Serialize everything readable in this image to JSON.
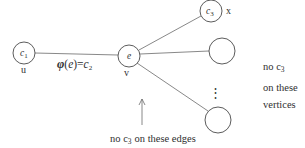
{
  "diagram_title": "edge-coloring gadget around vertex v",
  "nodes": {
    "u": {
      "inner_base": "c",
      "inner_sub": "1",
      "label": "u"
    },
    "v": {
      "inner": "e",
      "label": "v"
    },
    "x": {
      "inner_base": "c",
      "inner_sub": "3",
      "label": "x"
    },
    "mid": {
      "inner": ""
    },
    "bottom": {
      "inner": ""
    }
  },
  "edge_label": {
    "phi": "φ",
    "lparen": "(",
    "var": "e",
    "eq": ")=",
    "color": "c",
    "sub": "2"
  },
  "ellipsis": "⋮",
  "notes": {
    "vertices": {
      "l1a": "no c",
      "l1sub": "3",
      "l2": "on these",
      "l3": "vertices"
    },
    "edges": {
      "a": "no c",
      "sub": "3",
      "b": "on these edges"
    }
  },
  "colors": {
    "ink": "#2f2f2f",
    "line": "#6a6a6a",
    "node_stroke": "#4a4a4a",
    "bg": "#ffffff"
  }
}
